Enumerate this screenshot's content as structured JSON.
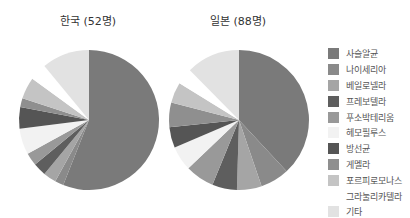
{
  "chart_data": [
    {
      "type": "pie",
      "title": "한국 (52명)",
      "start_angle": "12 o'clock, clockwise",
      "categories": [
        "사슬알균",
        "나이세리아",
        "베일로넬라",
        "프레보텔라",
        "푸소박테리움",
        "헤모필루스",
        "방선균",
        "게멜라",
        "포르피로모나스",
        "그라눌리카텔라",
        "기타"
      ],
      "values": [
        56,
        2,
        3,
        3,
        3,
        6,
        5,
        2,
        5,
        4,
        11
      ]
    },
    {
      "type": "pie",
      "title": "일본 (88명)",
      "start_angle": "12 o'clock, clockwise",
      "categories": [
        "사슬알균",
        "나이세리아",
        "베일로넬라",
        "프레보텔라",
        "푸소박테리움",
        "헤모필루스",
        "방선균",
        "게멜라",
        "포르피로모나스",
        "그라눌리카텔라",
        "기타"
      ],
      "values": [
        40,
        7,
        6,
        6,
        7,
        6,
        5,
        6,
        5,
        4,
        13
      ]
    }
  ],
  "legend": {
    "position": "right",
    "items": [
      {
        "label": "사슬알균",
        "color": "#7a7a7a"
      },
      {
        "label": "나이세리아",
        "color": "#8a8a8a"
      },
      {
        "label": "베일로넬라",
        "color": "#a5a5a5"
      },
      {
        "label": "프레보텔라",
        "color": "#5e5e5e"
      },
      {
        "label": "푸소박테리움",
        "color": "#999999"
      },
      {
        "label": "헤모필루스",
        "color": "#f2f2f2"
      },
      {
        "label": "방선균",
        "color": "#555555"
      },
      {
        "label": "게멜라",
        "color": "#8f8f8f"
      },
      {
        "label": "포르피로모나스",
        "color": "#c4c4c4"
      },
      {
        "label": "그라눌리카텔라",
        "color": "#ffffff"
      },
      {
        "label": "기타",
        "color": "#e2e2e2"
      }
    ]
  },
  "titles": {
    "korea": "한국 (52명)",
    "japan": "일본 (88명)"
  }
}
